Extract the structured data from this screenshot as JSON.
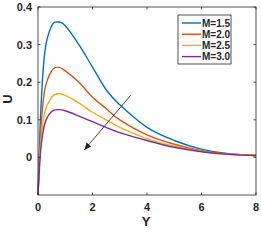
{
  "chart_data": {
    "type": "line",
    "title": "",
    "xlabel": "Y",
    "ylabel": "U",
    "xlim": [
      0,
      8
    ],
    "ylim": [
      -0.1,
      0.4
    ],
    "xticks": [
      0,
      2,
      4,
      6,
      8
    ],
    "yticks": [
      0,
      0.1,
      0.2,
      0.3,
      0.4
    ],
    "grid": false,
    "legend_position": "upper right",
    "x": [
      0,
      0.1,
      0.25,
      0.5,
      0.75,
      1.0,
      1.5,
      2.0,
      2.5,
      3.0,
      4.0,
      5.0,
      6.0,
      7.0,
      8.0
    ],
    "series": [
      {
        "name": "M=1.5",
        "color": "#0072BD",
        "values": [
          -0.1,
          0.12,
          0.28,
          0.35,
          0.36,
          0.35,
          0.3,
          0.24,
          0.18,
          0.14,
          0.08,
          0.045,
          0.022,
          0.01,
          0.005
        ]
      },
      {
        "name": "M=2.0",
        "color": "#D95319",
        "values": [
          -0.1,
          0.07,
          0.18,
          0.23,
          0.24,
          0.23,
          0.2,
          0.16,
          0.13,
          0.1,
          0.06,
          0.035,
          0.018,
          0.009,
          0.005
        ]
      },
      {
        "name": "M=2.5",
        "color": "#EDB120",
        "values": [
          -0.1,
          0.04,
          0.12,
          0.16,
          0.17,
          0.165,
          0.145,
          0.12,
          0.1,
          0.08,
          0.05,
          0.03,
          0.016,
          0.008,
          0.005
        ]
      },
      {
        "name": "M=3.0",
        "color": "#7E2F8E",
        "values": [
          -0.1,
          0.02,
          0.09,
          0.122,
          0.127,
          0.124,
          0.11,
          0.095,
          0.08,
          0.066,
          0.045,
          0.027,
          0.015,
          0.008,
          0.005
        ]
      }
    ],
    "annotations": [
      {
        "type": "arrow",
        "from": [
          3.4,
          0.165
        ],
        "to": [
          1.7,
          0.02
        ],
        "meaning": "increasing M"
      }
    ]
  }
}
